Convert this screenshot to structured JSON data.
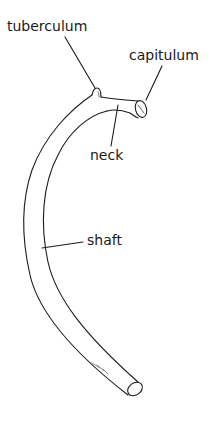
{
  "figure": {
    "labels": {
      "tuberculum": "tuberculum",
      "capitulum": "capitulum",
      "neck": "neck",
      "shaft": "shaft"
    },
    "colors": {
      "stroke": "#1a1a1a",
      "background": "#ffffff"
    }
  }
}
